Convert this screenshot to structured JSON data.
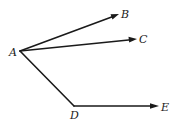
{
  "diagram": {
    "type": "geometry-rays",
    "points": {
      "A": {
        "label": "A",
        "x": 20,
        "y": 51
      },
      "B": {
        "label": "B",
        "x": 119,
        "y": 14
      },
      "C": {
        "label": "C",
        "x": 137,
        "y": 39
      },
      "D": {
        "label": "D",
        "x": 74,
        "y": 106
      },
      "E": {
        "label": "E",
        "x": 159,
        "y": 106
      }
    },
    "segments": [
      {
        "from": "A",
        "to": "B",
        "arrow": true
      },
      {
        "from": "A",
        "to": "C",
        "arrow": true
      },
      {
        "from": "A",
        "to": "D",
        "arrow": false
      },
      {
        "from": "D",
        "to": "E",
        "arrow": true
      }
    ],
    "color": "#1a1a1a"
  }
}
